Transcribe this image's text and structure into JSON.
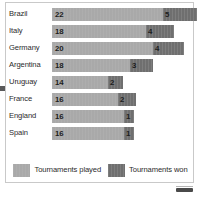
{
  "chart_data": {
    "type": "bar",
    "orientation": "horizontal",
    "stacked": true,
    "title": "",
    "xlabel": "",
    "ylabel": "",
    "grid": false,
    "legend_position": "bottom-center",
    "categories": [
      "Brazil",
      "Italy",
      "Germany",
      "Argentina",
      "Uruguay",
      "France",
      "England",
      "Spain"
    ],
    "series": [
      {
        "name": "Tournaments played",
        "color": "#a9a9a9",
        "values": [
          22,
          18,
          20,
          18,
          14,
          16,
          16,
          16
        ]
      },
      {
        "name": "Tournaments won",
        "color": "#6f6f6f",
        "values": [
          5,
          4,
          4,
          3,
          2,
          2,
          1,
          1
        ]
      }
    ],
    "rows": [
      {
        "label": "Brazil",
        "played": 22,
        "won": 5,
        "played_px": 111,
        "won_px": 34
      },
      {
        "label": "Italy",
        "played": 18,
        "won": 4,
        "played_px": 94,
        "won_px": 28
      },
      {
        "label": "Germany",
        "played": 20,
        "won": 4,
        "played_px": 101,
        "won_px": 31
      },
      {
        "label": "Argentina",
        "played": 18,
        "won": 3,
        "played_px": 78,
        "won_px": 23
      },
      {
        "label": "Uruguay",
        "played": 14,
        "won": 2,
        "played_px": 56,
        "won_px": 15
      },
      {
        "label": "France",
        "played": 16,
        "won": 2,
        "played_px": 66,
        "won_px": 18
      },
      {
        "label": "England",
        "played": 16,
        "won": 1,
        "played_px": 72,
        "won_px": 10
      },
      {
        "label": "Spain",
        "played": 16,
        "won": 1,
        "played_px": 72,
        "won_px": 10
      }
    ]
  },
  "legend": {
    "played_label": "Tournaments played",
    "won_label": "Tournaments won"
  },
  "colors": {
    "played": "#a9a9a9",
    "won": "#6f6f6f",
    "card_border": "#c9c9c9",
    "text": "#2b2b2b",
    "background": "#ffffff"
  }
}
